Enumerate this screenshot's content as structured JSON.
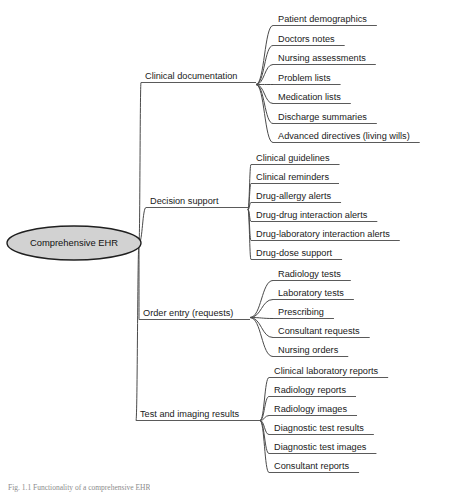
{
  "diagram": {
    "title": "Comprehensive EHR",
    "type": "mind-map",
    "root": {
      "label": "Comprehensive EHR",
      "shape": "ellipse",
      "fill": "#d2d2d2",
      "stroke": "#1f1f1f",
      "cx": 74,
      "cy": 243,
      "rx": 67,
      "ry": 17
    },
    "style": {
      "link_color": "#4a4a4a",
      "underline_color": "#5a5a5a",
      "text_color": "#1a1a1a",
      "background": "#ffffff"
    },
    "branches": [
      {
        "label": "Clinical documentation",
        "label_x": 145,
        "label_y": 79,
        "junction_x": 258,
        "junction_y": 81,
        "children": [
          {
            "label": "Patient demographics",
            "x": 278,
            "y": 22
          },
          {
            "label": "Doctors notes",
            "x": 278,
            "y": 42
          },
          {
            "label": "Nursing assessments",
            "x": 278,
            "y": 61
          },
          {
            "label": "Problem lists",
            "x": 278,
            "y": 81
          },
          {
            "label": "Medication lists",
            "x": 278,
            "y": 100
          },
          {
            "label": "Discharge summaries",
            "x": 278,
            "y": 120
          },
          {
            "label": "Advanced directives (living wills)",
            "x": 278,
            "y": 139
          }
        ]
      },
      {
        "label": "Decision support",
        "label_x": 150,
        "label_y": 204,
        "junction_x": 250,
        "junction_y": 206,
        "children": [
          {
            "label": "Clinical guidelines",
            "x": 256,
            "y": 161
          },
          {
            "label": "Clinical reminders",
            "x": 256,
            "y": 180
          },
          {
            "label": "Drug-allergy alerts",
            "x": 256,
            "y": 199
          },
          {
            "label": "Drug-drug interaction alerts",
            "x": 256,
            "y": 218
          },
          {
            "label": "Drug-laboratory interaction alerts",
            "x": 256,
            "y": 237
          },
          {
            "label": "Drug-dose support",
            "x": 256,
            "y": 256
          }
        ]
      },
      {
        "label": "Order entry (requests)",
        "label_x": 143,
        "label_y": 316,
        "junction_x": 252,
        "junction_y": 314,
        "children": [
          {
            "label": "Radiology tests",
            "x": 278,
            "y": 277
          },
          {
            "label": "Laboratory tests",
            "x": 278,
            "y": 296
          },
          {
            "label": "Prescribing",
            "x": 278,
            "y": 315
          },
          {
            "label": "Consultant requests",
            "x": 278,
            "y": 334
          },
          {
            "label": "Nursing orders",
            "x": 278,
            "y": 353
          }
        ]
      },
      {
        "label": "Test and imaging results",
        "label_x": 140,
        "label_y": 417,
        "junction_x": 262,
        "junction_y": 417,
        "children": [
          {
            "label": "Clinical laboratory reports",
            "x": 274,
            "y": 374
          },
          {
            "label": "Radiology reports",
            "x": 274,
            "y": 393
          },
          {
            "label": "Radiology images",
            "x": 274,
            "y": 412
          },
          {
            "label": "Diagnostic test results",
            "x": 274,
            "y": 431
          },
          {
            "label": "Diagnostic test images",
            "x": 274,
            "y": 450
          },
          {
            "label": "Consultant reports",
            "x": 274,
            "y": 469
          }
        ]
      }
    ]
  },
  "caption": {
    "text": "Fig. 1.1 Functionality of a comprehensive EHR"
  }
}
